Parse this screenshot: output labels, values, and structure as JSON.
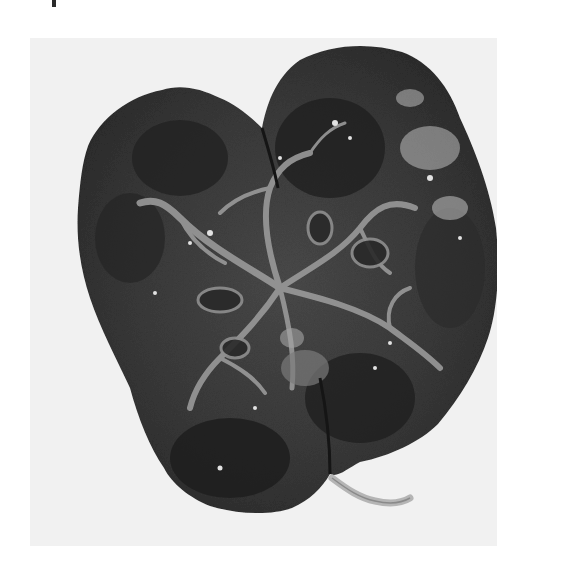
{
  "image": {
    "description": "Grayscale photograph of a bisected kidney specimen showing lobulated surface, dark cortex and medulla with pale branching vessels and collecting system, and a ureter stub at lower right",
    "subject": "kidney-cut-surface",
    "tones": {
      "page_background": "#ffffff",
      "photo_background": "#f1f1f1",
      "tissue_dark": "#2b2b2b",
      "tissue_mid": "#4a4a4a",
      "vessel_pale": "#9a9a9a",
      "highlight": "#dcdcdc"
    }
  },
  "fragment": {
    "note": "cropped glyph fragment at top edge"
  }
}
